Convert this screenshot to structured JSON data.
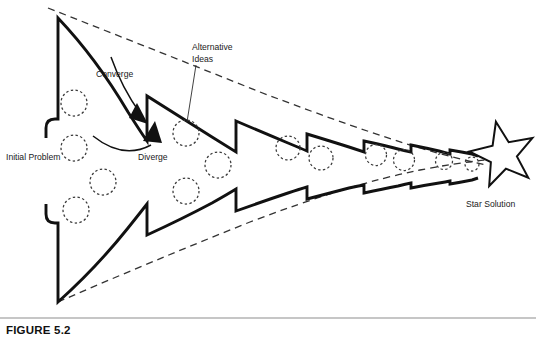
{
  "figure": {
    "caption": "FIGURE 5.2",
    "width": 536,
    "height": 342,
    "background_color": "#ffffff",
    "line_color": "#111111",
    "dash_color": "#333333",
    "circle_color": "#3a3a3a"
  },
  "labels": {
    "initial_problem": "Initial Problem",
    "converge": "Converge",
    "diverge": "Diverge",
    "alternative_ideas_line1": "Alternative",
    "alternative_ideas_line2": "Ideas",
    "star_solution": "Star Solution"
  },
  "diagram": {
    "type": "converge-diverge-process",
    "upper_band_path": "M 46 138 L 46 128 Q 46 119 55 119 L 58 119 L 58 18 Q 96 58 128 112 Q 140 131 147 141 L 147 96 Q 182 118 212 137 Q 228 147 236 152 L 236 121 Q 264 133 288 143 Q 300 148 307 151 L 307 134 Q 330 141 349 147 Q 358 150 364 152 L 364 141 Q 383 145 398 149 Q 406 151 411 152 L 411 145 Q 426 148 439 151 Q 446 153 450 154 L 450 150 Q 462 152 472 154 L 478 156",
    "lower_band_path": "M 46 204 L 46 214 Q 46 223 55 223 L 58 223 L 58 302 Q 96 268 128 228 Q 140 213 147 204 L 147 235 Q 182 219 212 203 Q 228 194 236 189 L 236 211 Q 264 201 288 193 Q 300 189 307 187 L 307 199 Q 330 193 349 188 Q 358 186 364 185 L 364 193 Q 383 189 398 186 Q 406 184 411 183 L 411 188 Q 426 185 439 183 Q 446 182 450 181 L 450 184 Q 462 182 472 180 L 478 178",
    "upper_envelope_path": "M 48 8 Q 160 52 260 92 Q 360 130 420 148 Q 458 159 486 165",
    "lower_envelope_path": "M 58 302 Q 150 262 250 222 Q 350 184 420 170 Q 456 163 486 160",
    "star": {
      "center_x": 503,
      "center_y": 155,
      "outer_radius": 34,
      "inner_radius": 14,
      "points": 5,
      "rotation_deg": -12
    },
    "idea_circles": [
      {
        "cx": 74,
        "cy": 103,
        "r": 13
      },
      {
        "cx": 74,
        "cy": 148,
        "r": 13
      },
      {
        "cx": 103,
        "cy": 182,
        "r": 13
      },
      {
        "cx": 76,
        "cy": 210,
        "r": 13
      },
      {
        "cx": 186,
        "cy": 133,
        "r": 13
      },
      {
        "cx": 218,
        "cy": 165,
        "r": 13
      },
      {
        "cx": 186,
        "cy": 191,
        "r": 13
      },
      {
        "cx": 288,
        "cy": 148,
        "r": 12
      },
      {
        "cx": 321,
        "cy": 158,
        "r": 12
      },
      {
        "cx": 376,
        "cy": 155,
        "r": 10.5
      },
      {
        "cx": 404,
        "cy": 160,
        "r": 10.5
      },
      {
        "cx": 444,
        "cy": 161,
        "r": 8.5
      },
      {
        "cx": 472,
        "cy": 164,
        "r": 7
      }
    ],
    "annotations": {
      "converge_arrow_path": "M 111 57 Q 122 88 140 113",
      "converge_arrow_head": "137 103 148 124 129 118",
      "diverge_arrow_path": "M 93 136 Q 123 160 151 145",
      "diverge_arrow_head": "155 121 162 143 143 141",
      "alt_ideas_leader_path": "M 196 65 L 187 122"
    },
    "label_positions": {
      "initial_problem": {
        "x": 6,
        "y": 160
      },
      "converge": {
        "x": 96,
        "y": 77
      },
      "diverge": {
        "x": 138,
        "y": 160
      },
      "alternative_ideas": {
        "x": 192,
        "y": 50
      },
      "star_solution": {
        "x": 466,
        "y": 207
      },
      "caption": {
        "x": 6,
        "y": 334
      }
    }
  }
}
